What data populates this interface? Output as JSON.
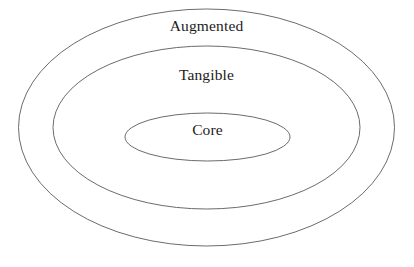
{
  "figure": {
    "type": "concentric-ellipse-venn",
    "background_color": "#ffffff",
    "stroke_color": "#5a5a5a",
    "text_color": "#1c1c1c",
    "clipped_top_text": "",
    "width": 414,
    "height": 267
  },
  "rings": [
    {
      "id": "augmented",
      "label": "Augmented",
      "level": 3,
      "cx": 206.5,
      "cy": 127.5,
      "rx": 188.0,
      "ry": 118.5,
      "label_x": 206.5,
      "label_y": 27.0
    },
    {
      "id": "tangible",
      "label": "Tangible",
      "level": 2,
      "cx": 206.5,
      "cy": 127.5,
      "rx": 153.5,
      "ry": 81.5,
      "label_x": 206.5,
      "label_y": 76.0
    },
    {
      "id": "core",
      "label": "Core",
      "level": 1,
      "cx": 207.5,
      "cy": 137.0,
      "rx": 82.5,
      "ry": 24.0,
      "label_x": 207.5,
      "label_y": 131.0
    }
  ]
}
